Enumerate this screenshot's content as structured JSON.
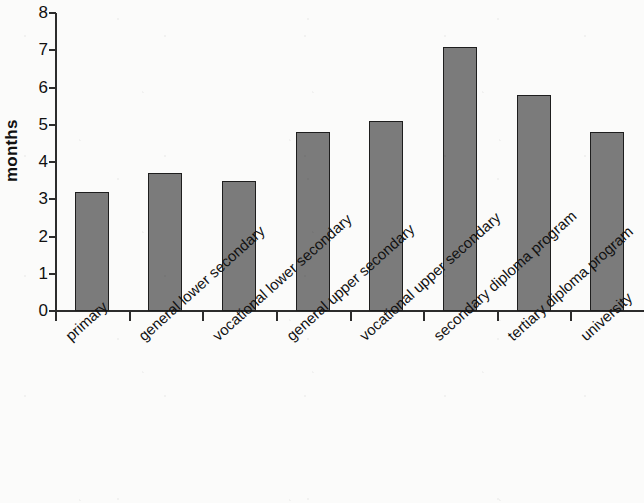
{
  "chart_data": {
    "type": "bar",
    "title": "",
    "xlabel": "",
    "ylabel": "months",
    "ylim": [
      0,
      8
    ],
    "yticks": [
      0,
      1,
      2,
      3,
      4,
      5,
      6,
      7,
      8
    ],
    "ytick_labels": [
      "0",
      "1",
      "2",
      "3",
      "4",
      "5",
      "6",
      "7",
      "8"
    ],
    "grid": false,
    "legend": null,
    "bar_color": "#7b7b7b",
    "bar_edge_color": "#1e1e1e",
    "categories": [
      "primary",
      "general lower secondary",
      "vocational lower secondary",
      "general upper secondary",
      "vocational upper secondary",
      "secondary diploma program",
      "tertiary diploma program",
      "university"
    ],
    "values": [
      3.2,
      3.7,
      3.5,
      4.8,
      5.1,
      7.1,
      5.8,
      4.8
    ]
  }
}
